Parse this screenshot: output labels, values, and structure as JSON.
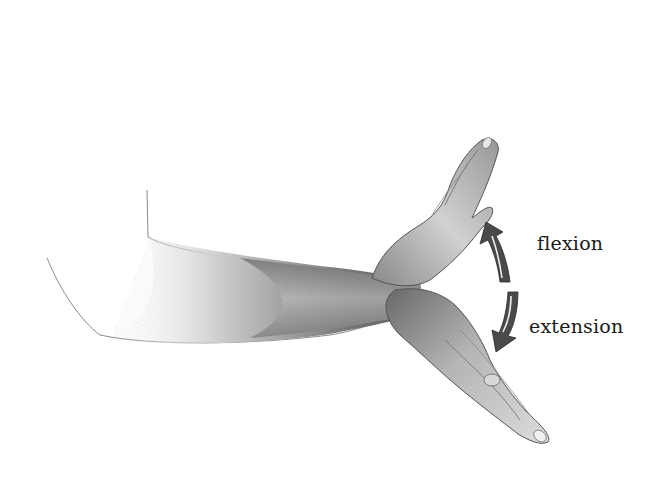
{
  "diagram": {
    "labels": {
      "flexion": "flexion",
      "extension": "extension"
    },
    "arrows": [
      {
        "name": "flexion-arrow",
        "direction": "up"
      },
      {
        "name": "extension-arrow",
        "direction": "down"
      }
    ],
    "colors": {
      "background": "#ffffff",
      "ink": "#1a1a1a",
      "arrow": "#4a4a4a",
      "shade_dark": "#555555",
      "shade_mid": "#9a9a9a",
      "shade_light": "#d8d8d8"
    }
  }
}
